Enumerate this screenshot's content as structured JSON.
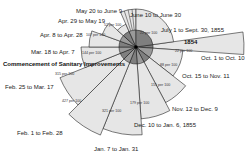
{
  "year_label": "1854",
  "annotation": "Commencement of Sanitary Improvements",
  "colors": {
    "outer_fill": "#e6e6e6",
    "inner_fill": "#9a9a9a",
    "inner_fill_dark": "#7f7f7f",
    "stroke": "#222222"
  },
  "center": {
    "x": 136,
    "y": 47
  },
  "chart_data": {
    "type": "rose",
    "title": "",
    "unit": "per 100",
    "sectors": [
      {
        "period": "Oct. 1 to Oct. 10",
        "value": 22,
        "label": "22 per 100"
      },
      {
        "period": "Oct. 15 to Nov. 11",
        "value": 88,
        "label": "88 per 100"
      },
      {
        "period": "Nov. 12 to Dec. 9",
        "value": 155,
        "label": "155 per 100"
      },
      {
        "period": "Dec. 10 to Jan. 6, 1855",
        "value": 179,
        "label": "179 per 100"
      },
      {
        "period": "Jan. 7 to Jan. 31",
        "value": 321,
        "label": "321 per 100"
      },
      {
        "period": "Feb. 1 to Feb. 28",
        "value": 427,
        "label": "427 per 100"
      },
      {
        "period": "Feb. 25 to Mar. 17",
        "value": 315,
        "label": "315 per 100"
      },
      {
        "period": "Mar. 18 to Apr. 7",
        "value": 144,
        "label": "144 per 100"
      },
      {
        "period": "Apr. 8 to Apr. 28",
        "value": 107,
        "label": "107 per 100"
      },
      {
        "period": "Apr. 29 to May 19",
        "value": 52,
        "label": "52 per 100"
      },
      {
        "period": "May 20 to June 9",
        "value": 20,
        "label": "20 per 100"
      },
      {
        "period": "June 10 to June 30",
        "value": 18,
        "label": "18 per 100"
      },
      {
        "period": "July 1 to Sept. 30, 1855",
        "value": 22,
        "label": "22 per 100"
      }
    ]
  },
  "labels": {
    "oct1": "Oct. 1 to Oct. 10",
    "oct15": "Oct. 15 to Nov. 11",
    "nov12": "Nov. 12 to Dec. 9",
    "dec10": "Dec. 10 to Jan. 6, 1855",
    "jan7": "Jan. 7 to Jan. 31",
    "feb1": "Feb. 1 to Feb. 28",
    "feb25": "Feb. 25 to Mar. 17",
    "mar18": "Mar. 18 to Apr. 7",
    "apr8": "Apr. 8 to Apr. 28",
    "apr29": "Apr. 29 to May 19",
    "may20": "May 20 to June 9",
    "jun10": "June 10 to June 30",
    "jul1": "July 1 to Sept. 30, 1855"
  },
  "values": {
    "oct1": "22 per 100",
    "oct15": "88 per 100",
    "nov12": "155 per 100",
    "dec10": "179 per 100",
    "jan7": "321 per 100",
    "feb1": "427 per 100",
    "feb25": "315 per 100",
    "mar18": "144 per 100",
    "apr8": "107 per 100",
    "apr29": "52 per 100",
    "jul1": "22 per 100"
  }
}
